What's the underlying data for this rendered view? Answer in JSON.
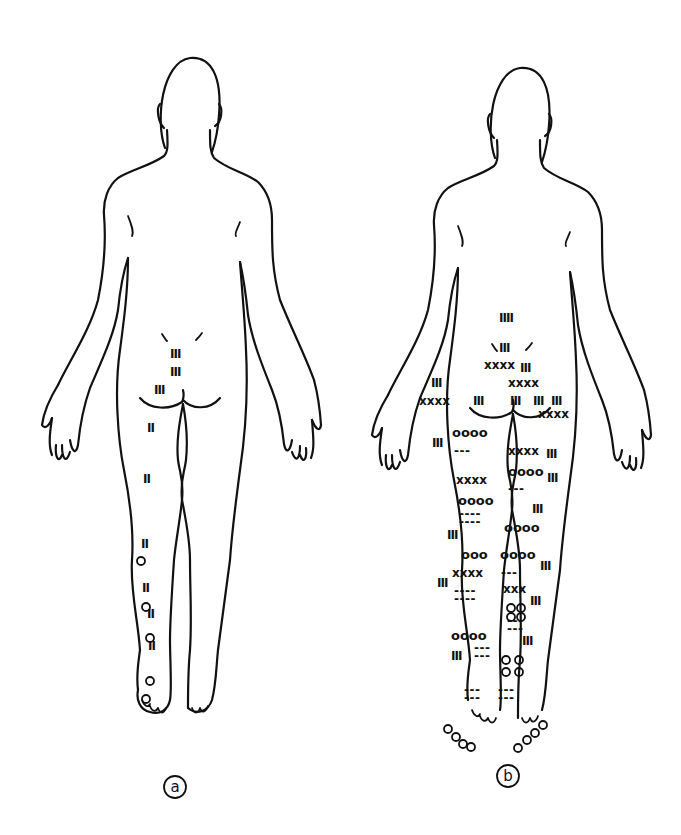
{
  "figure": {
    "panels": [
      {
        "id": "a",
        "label": "a"
      },
      {
        "id": "b",
        "label": "b"
      }
    ],
    "marker_legend_symbols": [
      "III",
      "XXXX",
      "OOOO",
      "---"
    ]
  },
  "panel_a": {
    "marks": [
      {
        "text": "III",
        "x": 170,
        "y": 358
      },
      {
        "text": "III",
        "x": 170,
        "y": 376
      },
      {
        "text": "III",
        "x": 154,
        "y": 394
      },
      {
        "text": "II",
        "x": 147,
        "y": 432
      },
      {
        "text": "II",
        "x": 143,
        "y": 483
      },
      {
        "text": "II",
        "x": 141,
        "y": 548
      },
      {
        "text": "II",
        "x": 142,
        "y": 592
      },
      {
        "text": "II",
        "x": 147,
        "y": 618
      },
      {
        "text": "II",
        "x": 148,
        "y": 650
      }
    ],
    "circles": [
      {
        "x": 141,
        "y": 561
      },
      {
        "x": 146,
        "y": 607
      },
      {
        "x": 150,
        "y": 638
      },
      {
        "x": 150,
        "y": 681
      },
      {
        "x": 146,
        "y": 699
      }
    ]
  },
  "panel_b": {
    "marks": [
      {
        "text": "IIII",
        "x": 499,
        "y": 322
      },
      {
        "text": "III",
        "x": 499,
        "y": 352
      },
      {
        "text": "XXXX",
        "x": 484,
        "y": 369
      },
      {
        "text": "III",
        "x": 520,
        "y": 372
      },
      {
        "text": "XXXX",
        "x": 508,
        "y": 387
      },
      {
        "text": "III",
        "x": 431,
        "y": 387
      },
      {
        "text": "XXXX",
        "x": 419,
        "y": 405
      },
      {
        "text": "III",
        "x": 473,
        "y": 405
      },
      {
        "text": "III",
        "x": 510,
        "y": 405
      },
      {
        "text": "III",
        "x": 533,
        "y": 405
      },
      {
        "text": "III",
        "x": 551,
        "y": 405
      },
      {
        "text": "XXXX",
        "x": 538,
        "y": 418
      },
      {
        "text": "OOOO",
        "x": 452,
        "y": 437
      },
      {
        "text": "III",
        "x": 432,
        "y": 447
      },
      {
        "text": "---",
        "x": 454,
        "y": 455
      },
      {
        "text": "XXXX",
        "x": 508,
        "y": 455
      },
      {
        "text": "III",
        "x": 546,
        "y": 458
      },
      {
        "text": "XXXX",
        "x": 456,
        "y": 484
      },
      {
        "text": "OOOO",
        "x": 508,
        "y": 476
      },
      {
        "text": "III",
        "x": 547,
        "y": 482
      },
      {
        "text": "---",
        "x": 508,
        "y": 493
      },
      {
        "text": "OOOO",
        "x": 458,
        "y": 505
      },
      {
        "text": "III",
        "x": 532,
        "y": 513
      },
      {
        "text": "----",
        "x": 459,
        "y": 518
      },
      {
        "text": "----",
        "x": 459,
        "y": 526
      },
      {
        "text": "III",
        "x": 447,
        "y": 539
      },
      {
        "text": "OOOO",
        "x": 504,
        "y": 532
      },
      {
        "text": "OOO",
        "x": 461,
        "y": 559
      },
      {
        "text": "OOOO",
        "x": 500,
        "y": 559
      },
      {
        "text": "XXXX",
        "x": 452,
        "y": 577
      },
      {
        "text": "---",
        "x": 501,
        "y": 577
      },
      {
        "text": "III",
        "x": 540,
        "y": 570
      },
      {
        "text": "III",
        "x": 437,
        "y": 587
      },
      {
        "text": "XXX",
        "x": 503,
        "y": 593
      },
      {
        "text": "----",
        "x": 454,
        "y": 595
      },
      {
        "text": "----",
        "x": 454,
        "y": 603
      },
      {
        "text": "III",
        "x": 530,
        "y": 605
      },
      {
        "text": "---",
        "x": 507,
        "y": 625
      },
      {
        "text": "---",
        "x": 507,
        "y": 633
      },
      {
        "text": "OOOO",
        "x": 451,
        "y": 640
      },
      {
        "text": "III",
        "x": 522,
        "y": 645
      },
      {
        "text": "III",
        "x": 451,
        "y": 660
      },
      {
        "text": "---",
        "x": 474,
        "y": 652
      },
      {
        "text": "---",
        "x": 474,
        "y": 660
      },
      {
        "text": "---",
        "x": 464,
        "y": 694
      },
      {
        "text": "---",
        "x": 464,
        "y": 702
      },
      {
        "text": "---",
        "x": 498,
        "y": 694
      },
      {
        "text": "---",
        "x": 498,
        "y": 702
      }
    ],
    "circle_clusters": [
      {
        "x": 506,
        "y": 660
      },
      {
        "x": 519,
        "y": 660
      },
      {
        "x": 506,
        "y": 672
      },
      {
        "x": 519,
        "y": 672
      },
      {
        "x": 511,
        "y": 608
      },
      {
        "x": 521,
        "y": 608
      },
      {
        "x": 511,
        "y": 617
      },
      {
        "x": 521,
        "y": 617
      },
      {
        "x": 448,
        "y": 729
      },
      {
        "x": 456,
        "y": 737
      },
      {
        "x": 463,
        "y": 744
      },
      {
        "x": 471,
        "y": 747
      },
      {
        "x": 518,
        "y": 748
      },
      {
        "x": 527,
        "y": 740
      },
      {
        "x": 535,
        "y": 733
      },
      {
        "x": 543,
        "y": 725
      }
    ]
  }
}
